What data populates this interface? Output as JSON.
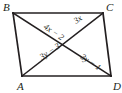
{
  "figure": {
    "type": "geometry-diagram",
    "shape": "parallelogram",
    "vertices": [
      {
        "name": "B",
        "label": "B",
        "position": "top-left",
        "x": 13,
        "y": 13
      },
      {
        "name": "C",
        "label": "C",
        "position": "top-right",
        "x": 103,
        "y": 13
      },
      {
        "name": "A",
        "label": "A",
        "position": "bottom-left",
        "x": 22,
        "y": 76
      },
      {
        "name": "D",
        "label": "D",
        "position": "bottom-right",
        "x": 111,
        "y": 76
      }
    ],
    "vertex_label_positions": [
      {
        "name": "B",
        "x": 3,
        "y": 11
      },
      {
        "name": "C",
        "x": 106,
        "y": 11
      },
      {
        "name": "A",
        "x": 17,
        "y": 90
      },
      {
        "name": "D",
        "x": 113,
        "y": 90
      }
    ],
    "segment_labels": [
      {
        "id": "bo",
        "text": "4x − 2",
        "segment": "B to center",
        "x": 43,
        "y": 28,
        "rotate": 34
      },
      {
        "id": "oc",
        "text": "3x",
        "segment": "center to C",
        "x": 76,
        "y": 24,
        "rotate": -34
      },
      {
        "id": "ao",
        "text": "3y − 3",
        "segment": "A to center",
        "x": 42,
        "y": 60,
        "rotate": -34
      },
      {
        "id": "od",
        "text": "3y − 1",
        "segment": "center to D",
        "x": 80,
        "y": 58,
        "rotate": 34
      }
    ],
    "colors": {
      "stroke": "#231f20",
      "background": "#ffffff",
      "text": "#231f20"
    }
  }
}
